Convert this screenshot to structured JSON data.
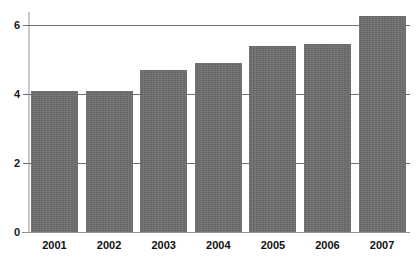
{
  "chart_data": {
    "type": "bar",
    "title": "",
    "subtitle": "",
    "xlabel": "",
    "ylabel": "",
    "categories": [
      "2001",
      "2002",
      "2003",
      "2004",
      "2005",
      "2006",
      "2007"
    ],
    "values": [
      4.1,
      4.1,
      4.7,
      4.9,
      5.4,
      5.45,
      6.25
    ],
    "series": [
      {
        "name": "",
        "values": [
          4.1,
          4.1,
          4.7,
          4.9,
          5.4,
          5.45,
          6.25
        ]
      }
    ],
    "ylim": [
      0,
      6.8
    ],
    "yticks": [
      0,
      2,
      4,
      6
    ],
    "ytick_labels": [
      "0",
      "2",
      "4",
      "6"
    ],
    "xtick_labels": [
      "2001",
      "2002",
      "2003",
      "2004",
      "2005",
      "2006",
      "2007"
    ],
    "grid": true,
    "grid_axis": "y",
    "legend": false,
    "legend_position": "none",
    "annotations": [],
    "colors": {
      "bar": "#6e6e6e",
      "gridline": "#6f6f6f",
      "axis": "#c9c9c9",
      "axis_x": "#8f8f8f",
      "text": "#111111",
      "background": "#ffffff"
    }
  }
}
